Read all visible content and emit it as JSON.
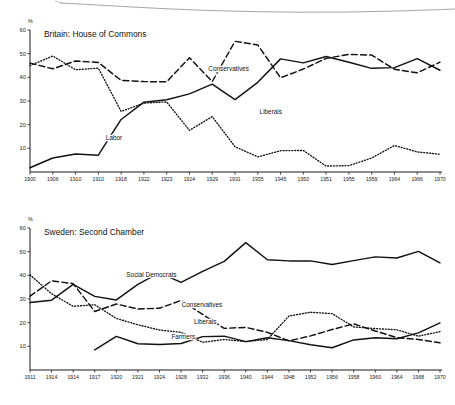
{
  "page": {
    "background": "#ffffff",
    "ink": "#111111",
    "has_bleed_curve": true
  },
  "charts": [
    {
      "id": "britain",
      "title": "Britain: House of Commons",
      "axis_unit": "%",
      "chart_data": {
        "type": "line",
        "title": "Britain: House of Commons",
        "xlabel": "",
        "ylabel": "%",
        "ylim": [
          0,
          60
        ],
        "yticks": [
          10,
          20,
          30,
          40,
          50,
          60
        ],
        "grid": false,
        "legend": "inline-labels",
        "categories": [
          "1900",
          "1906",
          "1910",
          "1910",
          "1918",
          "1922",
          "1923",
          "1924",
          "1929",
          "1931",
          "1935",
          "1945",
          "1950",
          "1951",
          "1955",
          "1959",
          "1964",
          "1966",
          "1970"
        ],
        "series": [
          {
            "name": "Conservatives",
            "style": "dashed",
            "values": [
              46.0,
              43.6,
              46.9,
              46.3,
              38.7,
              38.2,
              38.1,
              48.3,
              38.2,
              55.2,
              53.7,
              39.8,
              43.5,
              48.0,
              49.7,
              49.4,
              43.4,
              41.9,
              46.4
            ]
          },
          {
            "name": "Labor",
            "style": "solid",
            "values": [
              1.8,
              5.9,
              7.6,
              7.1,
              22.2,
              29.5,
              30.5,
              33.0,
              37.1,
              30.6,
              37.9,
              47.8,
              46.1,
              48.8,
              46.4,
              43.8,
              44.1,
              47.9,
              43.0
            ]
          },
          {
            "name": "Liberals",
            "style": "dotted",
            "values": [
              45.0,
              49.0,
              43.2,
              43.9,
              25.6,
              29.1,
              29.6,
              17.6,
              23.4,
              10.7,
              6.4,
              9.0,
              9.1,
              2.5,
              2.7,
              5.9,
              11.2,
              8.5,
              7.5
            ]
          }
        ]
      },
      "series_labels": [
        {
          "name": "Conservatives",
          "x": 0.435,
          "y": 42.5
        },
        {
          "name": "Liberals",
          "x": 0.56,
          "y": 24.5
        },
        {
          "name": "Labor",
          "x": 0.185,
          "y": 13.5
        }
      ]
    },
    {
      "id": "sweden",
      "title": "Sweden: Second Chamber",
      "axis_unit": "%",
      "chart_data": {
        "type": "line",
        "title": "Sweden: Second Chamber",
        "xlabel": "",
        "ylabel": "%",
        "ylim": [
          0,
          60
        ],
        "yticks": [
          10,
          20,
          30,
          40,
          50,
          60
        ],
        "grid": false,
        "legend": "inline-labels",
        "categories": [
          "1911",
          "1914",
          "1914",
          "1917",
          "1920",
          "1921",
          "1924",
          "1928",
          "1932",
          "1936",
          "1940",
          "1944",
          "1948",
          "1952",
          "1956",
          "1958",
          "1960",
          "1964",
          "1968",
          "1970"
        ],
        "series": [
          {
            "name": "Social Democrats",
            "style": "solid",
            "values": [
              28.5,
              29.5,
              36.2,
              31.1,
              29.6,
              36.2,
              41.1,
              37.0,
              41.7,
              45.9,
              53.8,
              46.6,
              46.1,
              46.1,
              44.6,
              46.2,
              47.8,
              47.3,
              50.1,
              45.3
            ]
          },
          {
            "name": "Conservatives",
            "style": "dashed",
            "values": [
              31.2,
              37.7,
              36.5,
              24.7,
              27.9,
              25.8,
              26.1,
              29.4,
              23.5,
              17.6,
              18.0,
              15.9,
              12.3,
              14.4,
              17.1,
              19.5,
              16.5,
              13.7,
              12.9,
              11.5
            ]
          },
          {
            "name": "Liberals",
            "style": "dotted",
            "values": [
              40.2,
              32.2,
              26.9,
              27.6,
              21.8,
              19.1,
              16.9,
              15.9,
              11.7,
              12.9,
              12.0,
              12.9,
              22.8,
              24.4,
              23.8,
              18.2,
              17.5,
              17.0,
              14.3,
              16.2
            ]
          },
          {
            "name": "Farmers",
            "style": "solid",
            "values": [
              null,
              null,
              null,
              8.5,
              14.2,
              11.1,
              10.8,
              11.2,
              14.1,
              14.3,
              12.0,
              13.6,
              12.4,
              10.7,
              9.4,
              12.7,
              13.6,
              13.2,
              15.7,
              19.9
            ]
          }
        ]
      },
      "series_labels": [
        {
          "name": "Social Democrats",
          "x": 0.235,
          "y": 39.5
        },
        {
          "name": "Conservatives",
          "x": 0.37,
          "y": 26.6
        },
        {
          "name": "Liberals",
          "x": 0.4,
          "y": 19.6
        },
        {
          "name": "Farmers",
          "x": 0.345,
          "y": 13.1
        }
      ]
    }
  ]
}
